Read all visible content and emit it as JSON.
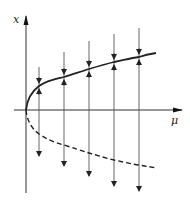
{
  "diagram": {
    "colors": {
      "stroke": "#222222",
      "flow": "#555555",
      "background": "#ffffff"
    },
    "axes": {
      "x_label": "μ",
      "y_label": "x"
    },
    "branches": [
      {
        "name": "stable-branch",
        "style": "solid"
      },
      {
        "name": "unstable-branch",
        "style": "dashed"
      }
    ],
    "flow_lines": [
      {
        "x": 39,
        "top": 67,
        "bottom": 156,
        "cross": 86
      },
      {
        "x": 64,
        "top": 52,
        "bottom": 166,
        "cross": 77
      },
      {
        "x": 89,
        "top": 41,
        "bottom": 176,
        "cross": 69
      },
      {
        "x": 114,
        "top": 34,
        "bottom": 186,
        "cross": 62
      },
      {
        "x": 139,
        "top": 28,
        "bottom": 191,
        "cross": 57
      }
    ]
  }
}
